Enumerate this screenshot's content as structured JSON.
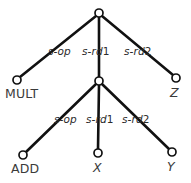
{
  "diagram": {
    "type": "abstract-syntax-tree",
    "colors": {
      "background": "#ffffff",
      "edge": "#111111",
      "node_stroke": "#111111",
      "node_fill": "#ffffff",
      "text": "#2b2b2b"
    },
    "nodes": [
      {
        "id": "root",
        "label": "",
        "x": 99,
        "y": 13,
        "r": 4.0,
        "leaf": false
      },
      {
        "id": "mult",
        "label": "MULT",
        "x": 17,
        "y": 80,
        "r": 4.0,
        "leaf": true
      },
      {
        "id": "inner",
        "label": "",
        "x": 99,
        "y": 81,
        "r": 4.0,
        "leaf": false
      },
      {
        "id": "z",
        "label": "Z",
        "x": 176,
        "y": 78,
        "r": 4.0,
        "leaf": true
      },
      {
        "id": "add",
        "label": "ADD",
        "x": 23,
        "y": 155,
        "r": 4.0,
        "leaf": true
      },
      {
        "id": "x",
        "label": "X",
        "x": 98,
        "y": 153,
        "r": 4.0,
        "leaf": true
      },
      {
        "id": "y",
        "label": "Y",
        "x": 172,
        "y": 152,
        "r": 4.0,
        "leaf": true
      }
    ],
    "edges": [
      {
        "id": "root-mult",
        "from": "root",
        "to": "mult",
        "label_stem": "s-op",
        "label_index": ""
      },
      {
        "id": "root-inner",
        "from": "root",
        "to": "inner",
        "label_stem": "s-rd",
        "label_index": "1"
      },
      {
        "id": "root-z",
        "from": "root",
        "to": "z",
        "label_stem": "s-rd",
        "label_index": "2"
      },
      {
        "id": "inner-add",
        "from": "inner",
        "to": "add",
        "label_stem": "s-op",
        "label_index": ""
      },
      {
        "id": "inner-x",
        "from": "inner",
        "to": "x",
        "label_stem": "s-rd",
        "label_index": "1"
      },
      {
        "id": "inner-y",
        "from": "inner",
        "to": "y",
        "label_stem": "s-rd",
        "label_index": "2"
      }
    ],
    "edge_labels": {
      "root_left": {
        "stem": "s-op",
        "index": "",
        "x": 48,
        "y": 46
      },
      "root_middle": {
        "stem": "s-rd",
        "index": "1",
        "x": 82,
        "y": 46
      },
      "root_right": {
        "stem": "s-rd",
        "index": "2",
        "x": 124,
        "y": 46
      },
      "inner_left": {
        "stem": "s-op",
        "index": "",
        "x": 54,
        "y": 114
      },
      "inner_middle": {
        "stem": "s-rd",
        "index": "1",
        "x": 86,
        "y": 114
      },
      "inner_right": {
        "stem": "s-rd",
        "index": "2",
        "x": 122,
        "y": 114
      }
    },
    "leaf_labels": {
      "mult": {
        "text": "MULT",
        "x": 5,
        "y": 88,
        "italic": false
      },
      "z": {
        "text": "Z",
        "x": 170,
        "y": 87,
        "italic": true
      },
      "add": {
        "text": "ADD",
        "x": 11,
        "y": 163,
        "italic": false
      },
      "x": {
        "text": "X",
        "x": 93,
        "y": 162,
        "italic": true
      },
      "y": {
        "text": "Y",
        "x": 167,
        "y": 161,
        "italic": true
      }
    }
  }
}
